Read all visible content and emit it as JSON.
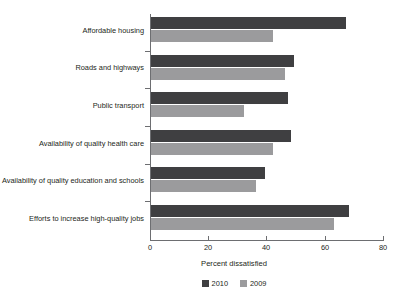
{
  "chart_data": {
    "type": "bar",
    "orientation": "horizontal",
    "title": "",
    "subtitle": "",
    "xlabel": "Percent dissatisfied",
    "ylabel": "",
    "xlim": [
      0,
      80
    ],
    "xticks": [
      0,
      20,
      40,
      60,
      80
    ],
    "xtick_labels": [
      "0",
      "20",
      "40",
      "60",
      "80"
    ],
    "grid": false,
    "legend_position": "bottom-center",
    "categories": [
      "Affordable housing",
      "Roads and highways",
      "Public transport",
      "Availability of quality health care",
      "Availability of quality education and schools",
      "Efforts to increase high-quality jobs"
    ],
    "series": [
      {
        "name": "2010",
        "color": "#3f3f41",
        "values": [
          67,
          49,
          47,
          48,
          39,
          68
        ]
      },
      {
        "name": "2009",
        "color": "#9b9b9d",
        "values": [
          42,
          46,
          32,
          42,
          36,
          63
        ]
      }
    ]
  },
  "legend": {
    "items": [
      {
        "label": "2010",
        "color": "#3f3f41"
      },
      {
        "label": "2009",
        "color": "#9b9b9d"
      }
    ]
  },
  "axis": {
    "x_title": "Percent dissatisfied"
  }
}
